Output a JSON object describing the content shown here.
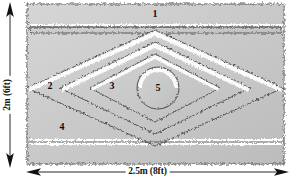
{
  "figure": {
    "type": "archaeological-plan-diagram",
    "colors": {
      "fill": "#c9c9c9",
      "fill_light": "#d4d4d4",
      "fill_shadow": "#bdbdbd",
      "highlight": "#ffffff",
      "outline": "#3a3a3a",
      "text": "#0a0a0a",
      "background": "#ffffff"
    }
  },
  "dimensions": {
    "horizontal": {
      "label": "2.5m (8ft)",
      "arrow_left": "arrow-left-icon",
      "arrow_right": "arrow-right-icon"
    },
    "vertical": {
      "label": "2m (6ft)",
      "arrow_up": "arrow-up-icon",
      "arrow_down": "arrow-down-icon"
    }
  },
  "zones": [
    {
      "id": "zone-1",
      "label": "1",
      "x": 155,
      "y": 14,
      "description": "outermost band, top edge"
    },
    {
      "id": "zone-2",
      "label": "2",
      "x": 50,
      "y": 86,
      "description": "second band, left point"
    },
    {
      "id": "zone-3",
      "label": "3",
      "x": 112,
      "y": 86,
      "description": "third band, inner lozenge"
    },
    {
      "id": "zone-4",
      "label": "4",
      "x": 62,
      "y": 127,
      "description": "second band, lower left"
    },
    {
      "id": "zone-5",
      "label": "5",
      "x": 158,
      "y": 88,
      "description": "central circular feature"
    }
  ]
}
